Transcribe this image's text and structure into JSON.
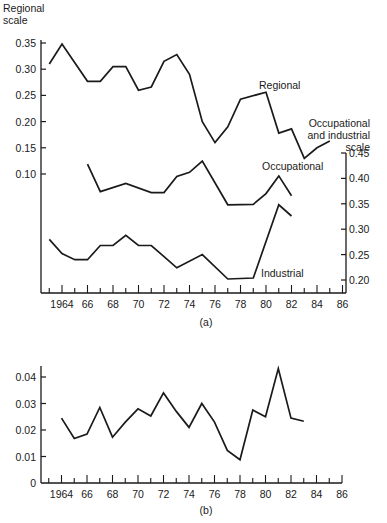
{
  "chart_data": [
    {
      "id": "a",
      "type": "line",
      "caption": "(a)",
      "xlabel": "",
      "x_ticks": [
        "1964",
        "66",
        "68",
        "70",
        "72",
        "74",
        "76",
        "78",
        "80",
        "82",
        "84",
        "86"
      ],
      "xlim": [
        1963,
        1986
      ],
      "grid": false,
      "left_axis": {
        "label_lines": [
          "Regional",
          "scale"
        ],
        "ylim": [
          0.1,
          0.35
        ],
        "ticks": [
          "0.35",
          "0.30",
          "0.25",
          "0.20",
          "0.15",
          "0.10"
        ]
      },
      "right_axis": {
        "label_lines": [
          "Occupational",
          "and industrial",
          "scale"
        ],
        "ylim": [
          0.2,
          0.45
        ],
        "ticks": [
          "0.45",
          "0.40",
          "0.35",
          "0.30",
          "0.25",
          "0.20"
        ]
      },
      "series": [
        {
          "name": "Regional",
          "axis": "left",
          "x": [
            1963,
            1964,
            1966,
            1967,
            1968,
            1969,
            1970,
            1971,
            1972,
            1973,
            1974,
            1975,
            1976,
            1977,
            1978,
            1980,
            1981,
            1982,
            1983,
            1984,
            1985
          ],
          "values": [
            0.31,
            0.348,
            0.277,
            0.277,
            0.305,
            0.305,
            0.26,
            0.266,
            0.315,
            0.328,
            0.29,
            0.2,
            0.16,
            0.19,
            0.243,
            0.256,
            0.178,
            0.186,
            0.13,
            0.15,
            0.163
          ]
        },
        {
          "name": "Occupational",
          "axis": "right",
          "x": [
            1966,
            1967,
            1969,
            1971,
            1972,
            1973,
            1974,
            1975,
            1977,
            1979,
            1980,
            1981,
            1982
          ],
          "values": [
            0.428,
            0.374,
            0.39,
            0.372,
            0.372,
            0.404,
            0.412,
            0.434,
            0.348,
            0.349,
            0.37,
            0.405,
            0.366
          ]
        },
        {
          "name": "Industrial",
          "axis": "right",
          "x": [
            1963,
            1964,
            1965,
            1966,
            1967,
            1968,
            1969,
            1970,
            1971,
            1973,
            1975,
            1977,
            1979,
            1981,
            1982
          ],
          "values": [
            0.28,
            0.252,
            0.24,
            0.24,
            0.268,
            0.268,
            0.288,
            0.268,
            0.268,
            0.224,
            0.25,
            0.202,
            0.204,
            0.348,
            0.326
          ]
        }
      ],
      "annotations": [
        "Regional",
        "Occupational",
        "Industrial"
      ]
    },
    {
      "id": "b",
      "type": "line",
      "caption": "(b)",
      "xlabel": "",
      "ylabel": "",
      "x_ticks": [
        "1964",
        "66",
        "68",
        "70",
        "72",
        "74",
        "76",
        "78",
        "80",
        "82",
        "84",
        "86"
      ],
      "xlim": [
        1963,
        1986
      ],
      "ylim": [
        0,
        0.04
      ],
      "y_ticks": [
        "0.04",
        "0.03",
        "0.02",
        "0.01",
        "0"
      ],
      "grid": false,
      "series": [
        {
          "name": "series",
          "x": [
            1964,
            1965,
            1966,
            1967,
            1968,
            1969,
            1970,
            1971,
            1972,
            1973,
            1974,
            1975,
            1976,
            1977,
            1978,
            1979,
            1980,
            1981,
            1982,
            1983
          ],
          "values": [
            0.0245,
            0.0168,
            0.0185,
            0.0285,
            0.0173,
            0.023,
            0.028,
            0.0253,
            0.034,
            0.027,
            0.021,
            0.03,
            0.023,
            0.0123,
            0.0088,
            0.0275,
            0.025,
            0.0432,
            0.0245,
            0.0233
          ]
        }
      ]
    }
  ]
}
